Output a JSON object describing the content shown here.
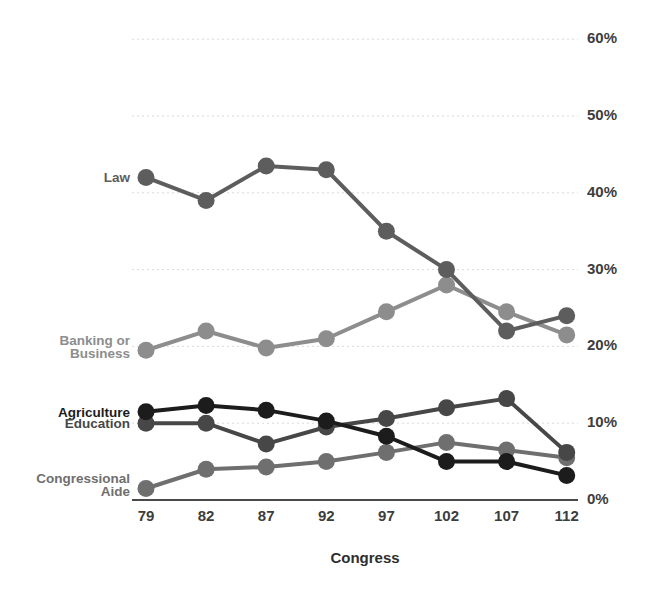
{
  "chart_data": {
    "type": "line",
    "title": "",
    "xlabel": "Congress",
    "ylabel": "",
    "categories": [
      "79",
      "82",
      "87",
      "92",
      "97",
      "102",
      "107",
      "112"
    ],
    "x_tick_labels": [
      "79",
      "82",
      "87",
      "92",
      "97",
      "102",
      "107",
      "112"
    ],
    "y_tick_labels": [
      "0%",
      "10%",
      "20%",
      "30%",
      "40%",
      "50%",
      "60%"
    ],
    "y_tick_values": [
      0,
      10,
      20,
      30,
      40,
      50,
      60
    ],
    "ylim": [
      0,
      60
    ],
    "grid": true,
    "grid_axis": "y",
    "legend_position": "inline-left",
    "series": [
      {
        "name": "Law",
        "label": "Law",
        "color": "#5d5d5d",
        "values": [
          42.0,
          39.0,
          43.5,
          43.0,
          35.0,
          30.0,
          22.0,
          24.0
        ]
      },
      {
        "name": "Banking or Business",
        "label": "Banking or\nBusiness",
        "label_line1": "Banking or",
        "label_line2": "Business",
        "color": "#8d8d8d",
        "values": [
          19.5,
          22.0,
          19.8,
          21.0,
          24.5,
          28.0,
          24.5,
          21.5
        ]
      },
      {
        "name": "Agriculture",
        "label": "Agriculture",
        "color": "#1c1c1c",
        "values": [
          11.5,
          12.3,
          11.7,
          10.3,
          8.3,
          5.0,
          5.0,
          3.2
        ]
      },
      {
        "name": "Education",
        "label": "Education",
        "color": "#474747",
        "values": [
          10.0,
          10.0,
          7.3,
          9.5,
          10.6,
          12.0,
          13.2,
          6.2
        ]
      },
      {
        "name": "Congressional Aide",
        "label": "Congressional\nAide",
        "label_line1": "Congressional",
        "label_line2": "Aide",
        "color": "#6f6f6f",
        "values": [
          1.5,
          4.0,
          4.3,
          5.0,
          6.2,
          7.5,
          6.5,
          5.5
        ]
      }
    ]
  },
  "axes": {
    "x_title": "Congress",
    "grid_color": "#d9d9d9",
    "axis_color": "#4a4a4a"
  }
}
